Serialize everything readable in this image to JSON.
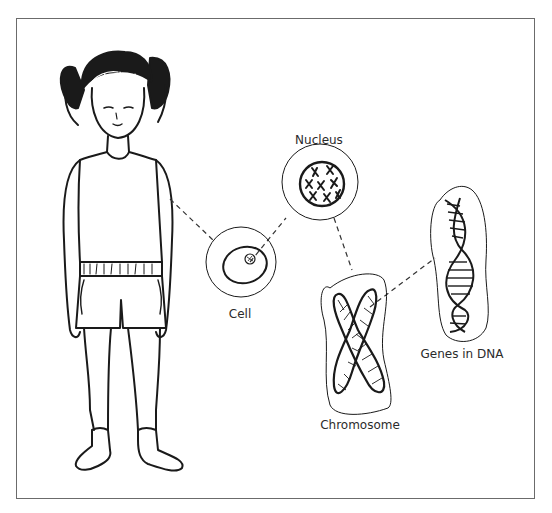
{
  "diagram": {
    "labels": {
      "nucleus": "Nucleus",
      "cell": "Cell",
      "chromosome": "Chromosome",
      "dna": "Genes in DNA"
    },
    "connections": [
      {
        "from": "child",
        "to": "cell"
      },
      {
        "from": "cell",
        "to": "nucleus"
      },
      {
        "from": "nucleus",
        "to": "chromosome"
      },
      {
        "from": "chromosome",
        "to": "dna"
      }
    ],
    "colors": {
      "line": "#1a1a1a",
      "border": "#6b6b6b",
      "background": "#ffffff"
    }
  }
}
